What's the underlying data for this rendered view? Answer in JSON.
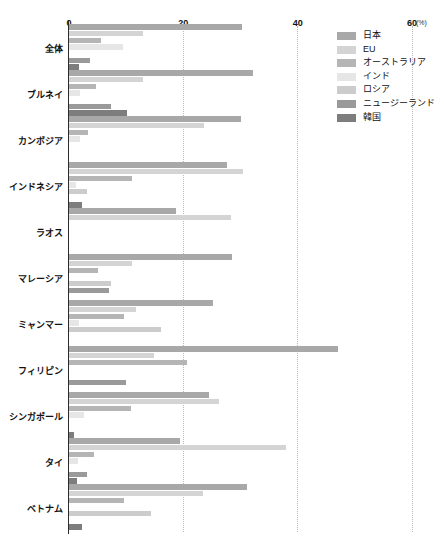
{
  "chart_data": {
    "type": "bar",
    "orientation": "horizontal",
    "title": "",
    "xlabel": "(%)",
    "ylabel": "",
    "xlim": [
      0,
      60
    ],
    "xticks": [
      0,
      20,
      40,
      60
    ],
    "xtick_labels": [
      "0",
      "20",
      "40",
      "60"
    ],
    "unit_label": "(%)",
    "grid": true,
    "grid_style": "dotted-vertical",
    "legend_position": "top-right",
    "categories": [
      "全体",
      "ブルネイ",
      "カンボジア",
      "インドネシア",
      "ラオス",
      "マレーシア",
      "ミャンマー",
      "フィリピン",
      "シンガポール",
      "タイ",
      "ベトナム"
    ],
    "series": [
      {
        "name": "日本",
        "color": "#a8a8a8",
        "values": [
          30.2,
          32.2,
          30.0,
          27.6,
          18.8,
          28.6,
          25.2,
          47.0,
          24.5,
          19.4,
          31.1
        ]
      },
      {
        "name": "EU",
        "color": "#d4d4d4",
        "values": [
          12.9,
          13.0,
          23.7,
          30.5,
          28.3,
          11.1,
          11.8,
          14.9,
          26.3,
          37.9,
          23.4
        ]
      },
      {
        "name": "オーストラリア",
        "color": "#b5b5b5",
        "values": [
          5.6,
          4.7,
          3.3,
          11.0,
          0.0,
          5.0,
          9.6,
          20.6,
          10.9,
          4.4,
          9.7
        ]
      },
      {
        "name": "インド",
        "color": "#e6e6e6",
        "values": [
          9.4,
          2.0,
          2.0,
          1.3,
          0.0,
          0.0,
          1.7,
          0.0,
          2.7,
          1.6,
          0.0
        ]
      },
      {
        "name": "ロシア",
        "color": "#cccccc",
        "values": [
          0.0,
          0.0,
          0.0,
          3.2,
          0.0,
          7.3,
          16.1,
          0.0,
          0.0,
          0.0,
          14.4
        ]
      },
      {
        "name": "ニュージーランド",
        "color": "#9a9a9a",
        "values": [
          3.6,
          7.3,
          0.0,
          0.0,
          0.0,
          7.0,
          0.0,
          10.0,
          0.0,
          3.2,
          0.0
        ]
      },
      {
        "name": "韓国",
        "color": "#7d7d7d",
        "values": [
          1.7,
          10.2,
          0.0,
          2.2,
          0.0,
          0.0,
          0.0,
          0.0,
          0.9,
          1.4,
          2.2
        ]
      }
    ]
  },
  "legend": {
    "items": [
      {
        "label": "日本",
        "color": "#a8a8a8"
      },
      {
        "label": "EU",
        "color": "#d4d4d4"
      },
      {
        "label": "オーストラリア",
        "color": "#b5b5b5"
      },
      {
        "label": "インド",
        "color": "#e6e6e6"
      },
      {
        "label": "ロシア",
        "color": "#cccccc"
      },
      {
        "label": "ニュージーランド",
        "color": "#9a9a9a"
      },
      {
        "label": "韓国",
        "color": "#7d7d7d"
      }
    ]
  },
  "layout": {
    "plot_left": 69,
    "plot_right": 412,
    "plot_top": 26,
    "plot_bottom": 532,
    "axis_label_y": 18,
    "unit_label_x": 416,
    "legend_x": 337,
    "legend_y": 29,
    "bar_height": 5.4,
    "bar_gap": 1.3,
    "group_count": 11
  }
}
